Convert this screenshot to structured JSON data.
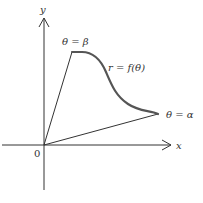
{
  "diagram": {
    "axes": {
      "x_label": "x",
      "y_label": "y",
      "origin_label": "0"
    },
    "rays": [
      {
        "label": "θ = β"
      },
      {
        "label": "θ = α"
      }
    ],
    "curve": {
      "label": "r = f(θ)"
    },
    "colors": {
      "axis": "#333333",
      "ray": "#333333",
      "curve": "#555555",
      "text": "#333333"
    }
  }
}
